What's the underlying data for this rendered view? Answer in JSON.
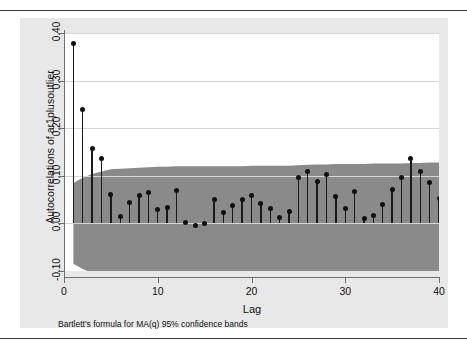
{
  "figure": {
    "type": "stata-correlogram",
    "note": "Bartlett's formula for MA(q) 95% confidence bands",
    "background": "#e8e8e8",
    "plot_background": "#ffffff",
    "band_color": "#8a8a8a",
    "spike_color": "#1a1a1a"
  },
  "chart_data": {
    "type": "line",
    "title": "",
    "subtitle": "",
    "xlabel": "Lag",
    "ylabel": "Autocorrelations of ar1plusoutlier",
    "annotation": "Bartlett's formula for MA(q) 95% confidence bands",
    "xlim": [
      0,
      40
    ],
    "ylim": [
      -0.1,
      0.4
    ],
    "xticks": [
      0,
      10,
      20,
      30,
      40
    ],
    "xtick_labels": [
      "0",
      "10",
      "20",
      "30",
      "40"
    ],
    "yticks": [
      -0.1,
      0.0,
      0.1,
      0.2,
      0.3,
      0.4
    ],
    "ytick_labels": [
      "-0.10",
      "0.00",
      "0.10",
      "0.20",
      "0.30",
      "0.40"
    ],
    "grid": true,
    "grid_axis": "y",
    "legend": "none",
    "x": [
      1,
      2,
      3,
      4,
      5,
      6,
      7,
      8,
      9,
      10,
      11,
      12,
      13,
      14,
      15,
      16,
      17,
      18,
      19,
      20,
      21,
      22,
      23,
      24,
      25,
      26,
      27,
      28,
      29,
      30,
      31,
      32,
      33,
      34,
      35,
      36,
      37,
      38,
      39,
      40
    ],
    "series": [
      {
        "name": "Autocorrelations of ar1plusoutlier",
        "marker": "circle",
        "values": [
          0.377,
          0.24,
          0.157,
          0.136,
          0.06,
          0.014,
          0.043,
          0.058,
          0.065,
          0.03,
          0.034,
          0.069,
          0.002,
          -0.005,
          0.0,
          0.05,
          0.022,
          0.038,
          0.051,
          0.058,
          0.042,
          0.031,
          0.012,
          0.026,
          0.097,
          0.108,
          0.089,
          0.102,
          0.057,
          0.032,
          0.068,
          0.01,
          0.016,
          0.04,
          0.072,
          0.097,
          0.137,
          0.109,
          0.086,
          0.053
        ]
      }
    ],
    "confidence_band": {
      "label": "Bartlett's formula for MA(q) 95% confidence bands",
      "level": 0.95,
      "upper": [
        0.085,
        0.096,
        0.104,
        0.109,
        0.114,
        0.115,
        0.116,
        0.117,
        0.118,
        0.119,
        0.119,
        0.12,
        0.12,
        0.12,
        0.12,
        0.12,
        0.12,
        0.12,
        0.12,
        0.121,
        0.121,
        0.121,
        0.121,
        0.121,
        0.122,
        0.123,
        0.124,
        0.124,
        0.125,
        0.125,
        0.125,
        0.125,
        0.126,
        0.126,
        0.126,
        0.126,
        0.127,
        0.127,
        0.128,
        0.128
      ],
      "lower": [
        -0.085,
        -0.096,
        -0.104,
        -0.109,
        -0.114,
        -0.115,
        -0.116,
        -0.117,
        -0.118,
        -0.119,
        -0.119,
        -0.12,
        -0.12,
        -0.12,
        -0.12,
        -0.12,
        -0.12,
        -0.12,
        -0.12,
        -0.121,
        -0.121,
        -0.121,
        -0.121,
        -0.121,
        -0.122,
        -0.123,
        -0.124,
        -0.124,
        -0.125,
        -0.125,
        -0.125,
        -0.125,
        -0.126,
        -0.126,
        -0.126,
        -0.126,
        -0.127,
        -0.127,
        -0.128,
        -0.128
      ]
    }
  }
}
